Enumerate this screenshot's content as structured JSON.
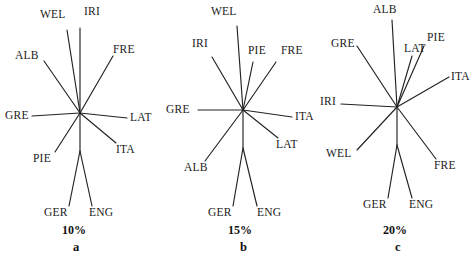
{
  "figure": {
    "type": "unrooted-network-triptych",
    "background_color": "#ffffff",
    "line_color": "#222222",
    "text_color": "#1a1a1a",
    "width": 476,
    "height": 256
  },
  "chart_data": {
    "type": "scatter",
    "title": "",
    "xlabel": "",
    "ylabel": "",
    "grid": false,
    "legend": null,
    "panels": [
      {
        "id": "a",
        "letter": "a",
        "scale": "10%",
        "center": [
          80,
          113
        ],
        "taxa": [
          "WEL",
          "IRI",
          "FRE",
          "LAT",
          "ITA",
          "ENG",
          "GER",
          "PIE",
          "GRE",
          "ALB"
        ],
        "leaves": [
          {
            "name": "WEL",
            "tip": [
              67,
              30
            ],
            "label_x": 40,
            "label_y": 9,
            "anchor": "start"
          },
          {
            "name": "IRI",
            "tip": [
              80,
              28
            ],
            "label_x": 84,
            "label_y": 6,
            "anchor": "start"
          },
          {
            "name": "FRE",
            "tip": [
              113,
              56
            ],
            "label_x": 113,
            "label_y": 44,
            "anchor": "start"
          },
          {
            "name": "LAT",
            "tip": [
              127,
              118
            ],
            "label_x": 130,
            "label_y": 112,
            "anchor": "start"
          },
          {
            "name": "ITA",
            "tip": [
              116,
              143
            ],
            "label_x": 116,
            "label_y": 144,
            "anchor": "start"
          },
          {
            "name": "ENG",
            "tip": [
              92,
              206
            ],
            "label_x": 89,
            "label_y": 207,
            "anchor": "start"
          },
          {
            "name": "GER",
            "tip": [
              69,
              206
            ],
            "label_x": 44,
            "label_y": 207,
            "anchor": "start"
          },
          {
            "name": "PIE",
            "tip": [
              55,
              152
            ],
            "label_x": 33,
            "label_y": 153,
            "anchor": "start"
          },
          {
            "name": "GRE",
            "tip": [
              32,
              116
            ],
            "label_x": 5,
            "label_y": 110,
            "anchor": "start"
          },
          {
            "name": "ALB",
            "tip": [
              44,
              61
            ],
            "label_x": 15,
            "label_y": 50,
            "anchor": "start"
          }
        ],
        "scale_label_x": 62,
        "scale_label_y": 224,
        "letter_x": 73,
        "letter_y": 241
      },
      {
        "id": "b",
        "letter": "b",
        "scale": "15%",
        "center": [
          243,
          110
        ],
        "taxa": [
          "WEL",
          "IRI",
          "PIE",
          "FRE",
          "ITA",
          "LAT",
          "ENG",
          "GER",
          "ALB",
          "GRE"
        ],
        "leaves": [
          {
            "name": "WEL",
            "tip": [
              237,
              26
            ],
            "label_x": 211,
            "label_y": 6,
            "anchor": "start"
          },
          {
            "name": "IRI",
            "tip": [
              212,
              57
            ],
            "label_x": 192,
            "label_y": 38,
            "anchor": "start"
          },
          {
            "name": "PIE",
            "tip": [
              253,
              62
            ],
            "label_x": 248,
            "label_y": 45,
            "anchor": "start"
          },
          {
            "name": "FRE",
            "tip": [
              276,
              62
            ],
            "label_x": 281,
            "label_y": 45,
            "anchor": "start"
          },
          {
            "name": "ITA",
            "tip": [
              292,
              117
            ],
            "label_x": 295,
            "label_y": 111,
            "anchor": "start"
          },
          {
            "name": "LAT",
            "tip": [
              278,
              138
            ],
            "label_x": 276,
            "label_y": 139,
            "anchor": "start"
          },
          {
            "name": "ENG",
            "tip": [
              257,
              206
            ],
            "label_x": 257,
            "label_y": 207,
            "anchor": "start"
          },
          {
            "name": "GER",
            "tip": [
              233,
              206
            ],
            "label_x": 208,
            "label_y": 207,
            "anchor": "start"
          },
          {
            "name": "ALB",
            "tip": [
              205,
              161
            ],
            "label_x": 184,
            "label_y": 162,
            "anchor": "start"
          },
          {
            "name": "GRE",
            "tip": [
              198,
              110
            ],
            "label_x": 166,
            "label_y": 104,
            "anchor": "start"
          }
        ],
        "scale_label_x": 228,
        "scale_label_y": 224,
        "letter_x": 240,
        "letter_y": 241
      },
      {
        "id": "c",
        "letter": "c",
        "scale": "20%",
        "center": [
          397,
          107
        ],
        "taxa": [
          "ALB",
          "GRE",
          "LAT",
          "PIE",
          "ITA",
          "IRI",
          "WEL",
          "FRE",
          "ENG",
          "GER"
        ],
        "leaves": [
          {
            "name": "ALB",
            "tip": [
              392,
              20
            ],
            "label_x": 373,
            "label_y": 4,
            "anchor": "start"
          },
          {
            "name": "GRE",
            "tip": [
              357,
              46
            ],
            "label_x": 331,
            "label_y": 38,
            "anchor": "start"
          },
          {
            "name": "LAT",
            "tip": [
              412,
              56
            ],
            "label_x": 404,
            "label_y": 43,
            "anchor": "start"
          },
          {
            "name": "PIE",
            "tip": [
              424,
              46
            ],
            "label_x": 427,
            "label_y": 32,
            "anchor": "start"
          },
          {
            "name": "ITA",
            "tip": [
              449,
              77
            ],
            "label_x": 451,
            "label_y": 71,
            "anchor": "start"
          },
          {
            "name": "IRI",
            "tip": [
              341,
              104
            ],
            "label_x": 320,
            "label_y": 96,
            "anchor": "start"
          },
          {
            "name": "WEL",
            "tip": [
              357,
              150
            ],
            "label_x": 326,
            "label_y": 148,
            "anchor": "start"
          },
          {
            "name": "FRE",
            "tip": [
              436,
              159
            ],
            "label_x": 434,
            "label_y": 160,
            "anchor": "start"
          },
          {
            "name": "ENG",
            "tip": [
              412,
              198
            ],
            "label_x": 409,
            "label_y": 199,
            "anchor": "start"
          },
          {
            "name": "GER",
            "tip": [
              388,
              198
            ],
            "label_x": 363,
            "label_y": 199,
            "anchor": "start"
          }
        ],
        "scale_label_x": 383,
        "scale_label_y": 224,
        "letter_x": 395,
        "letter_y": 241
      }
    ]
  },
  "labels": {
    "WEL": "WEL",
    "IRI": "IRI",
    "FRE": "FRE",
    "LAT": "LAT",
    "ITA": "ITA",
    "ENG": "ENG",
    "GER": "GER",
    "PIE": "PIE",
    "GRE": "GRE",
    "ALB": "ALB"
  },
  "scales": {
    "a": "10%",
    "b": "15%",
    "c": "20%"
  },
  "letters": {
    "a": "a",
    "b": "b",
    "c": "c"
  }
}
